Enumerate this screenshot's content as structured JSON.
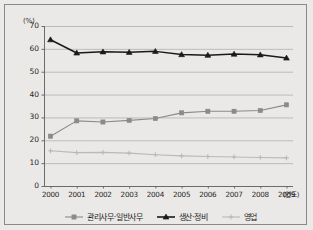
{
  "chart_data": {
    "type": "line",
    "title": "",
    "subtitle": "",
    "xlabel": "(연도)",
    "ylabel": "(%)",
    "categories": [
      "2000",
      "2001",
      "2002",
      "2003",
      "2004",
      "2005",
      "2006",
      "2007",
      "2008",
      "2009"
    ],
    "x": [
      2000,
      2001,
      2002,
      2003,
      2004,
      2005,
      2006,
      2007,
      2008,
      2009
    ],
    "xlim": [
      1999.6,
      2009.6
    ],
    "ylim": [
      0,
      70
    ],
    "yticks": [
      0,
      10,
      20,
      30,
      40,
      50,
      60,
      70
    ],
    "ytick_labels": [
      "0",
      "10",
      "20",
      "30",
      "40",
      "50",
      "60",
      "70"
    ],
    "grid": "horizontal",
    "legend_position": "bottom",
    "series": [
      {
        "name": "관리사무·일반사무",
        "color": "#8a8a8a",
        "marker": "square",
        "values": [
          21.8,
          28.5,
          28.0,
          28.7,
          29.5,
          32.0,
          32.7,
          32.7,
          33.0,
          35.5
        ]
      },
      {
        "name": "생산·정비",
        "color": "#1a1a1a",
        "marker": "triangle",
        "values": [
          64.0,
          58.2,
          58.7,
          58.5,
          58.9,
          57.5,
          57.2,
          57.7,
          57.4,
          56.0
        ]
      },
      {
        "name": "영업",
        "color": "#b9b9b9",
        "marker": "plus",
        "values": [
          15.4,
          14.6,
          14.7,
          14.4,
          13.7,
          13.2,
          12.9,
          12.7,
          12.5,
          12.3
        ]
      }
    ]
  },
  "axes": {
    "y_unit": "(%)",
    "x_unit": "(연도)"
  },
  "legend": {
    "items": [
      {
        "label": "관리사무·일반사무",
        "color": "#8a8a8a",
        "marker": "square"
      },
      {
        "label": "생산·정비",
        "color": "#1a1a1a",
        "marker": "triangle"
      },
      {
        "label": "영업",
        "color": "#b9b9b9",
        "marker": "plus"
      }
    ]
  },
  "colors": {
    "background": "#ebe9e7",
    "frame": "#8c8a86",
    "grid": "#a8a8a8",
    "axis": "#6b6b6b"
  }
}
